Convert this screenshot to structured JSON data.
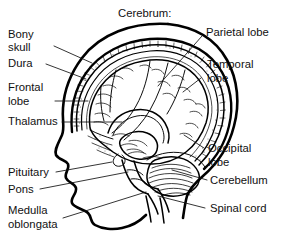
{
  "figure": {
    "kind": "anatomical-diagram",
    "background_color": "#ffffff",
    "ink_color": "#000000",
    "title": "Cerebrum:"
  },
  "labels": {
    "title": "Cerebrum:",
    "bony_skull_line1": "Bony",
    "bony_skull_line2": "skull",
    "dura": "Dura",
    "frontal_line1": "Frontal",
    "frontal_line2": "lobe",
    "thalamus": "Thalamus",
    "pituitary": "Pituitary",
    "pons": "Pons",
    "medulla_line1": "Medulla",
    "medulla_line2": "oblongata",
    "parietal": "Parietal lobe",
    "temporal_line1": "Temporal",
    "temporal_line2": "lobe",
    "occipital_line1": "Occipital",
    "occipital_line2": "lobe",
    "cerebellum": "Cerebellum",
    "spinal_cord": "Spinal cord"
  },
  "label_list": [
    {
      "id": "bony-skull",
      "text": "Bony skull",
      "side": "left",
      "lines": 2
    },
    {
      "id": "dura",
      "text": "Dura",
      "side": "left",
      "lines": 1
    },
    {
      "id": "frontal",
      "text": "Frontal lobe",
      "side": "left",
      "lines": 2
    },
    {
      "id": "thalamus",
      "text": "Thalamus",
      "side": "left",
      "lines": 1
    },
    {
      "id": "pituitary",
      "text": "Pituitary",
      "side": "left",
      "lines": 1
    },
    {
      "id": "pons",
      "text": "Pons",
      "side": "left",
      "lines": 1
    },
    {
      "id": "medulla",
      "text": "Medulla oblongata",
      "side": "left",
      "lines": 2
    },
    {
      "id": "parietal",
      "text": "Parietal lobe",
      "side": "right",
      "lines": 1
    },
    {
      "id": "temporal",
      "text": "Temporal lobe",
      "side": "right",
      "lines": 2
    },
    {
      "id": "occipital",
      "text": "Occipital lobe",
      "side": "right",
      "lines": 2
    },
    {
      "id": "cerebellum",
      "text": "Cerebellum",
      "side": "right",
      "lines": 1
    },
    {
      "id": "spinal-cord",
      "text": "Spinal cord",
      "side": "right",
      "lines": 1
    }
  ]
}
